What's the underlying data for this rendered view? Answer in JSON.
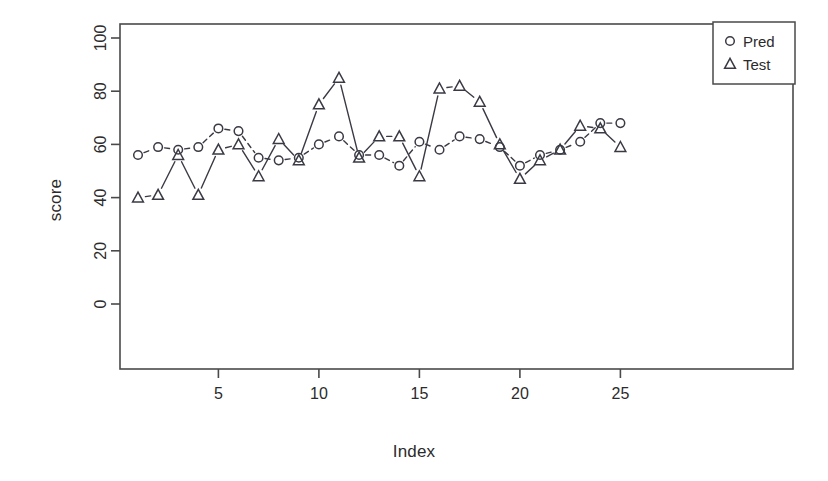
{
  "chart_data": {
    "type": "line",
    "title": "",
    "xlabel": "Index",
    "ylabel": "score",
    "x": [
      1,
      2,
      3,
      4,
      5,
      6,
      7,
      8,
      9,
      10,
      11,
      12,
      13,
      14,
      15,
      16,
      17,
      18,
      19,
      20,
      21,
      22,
      23,
      24,
      25
    ],
    "series": [
      {
        "name": "Pred",
        "marker": "circle",
        "linestyle": "dashed",
        "values": [
          56,
          59,
          58,
          59,
          66,
          65,
          55,
          54,
          55,
          60,
          63,
          56,
          56,
          52,
          61,
          58,
          63,
          62,
          59,
          52,
          56,
          58,
          61,
          68,
          68
        ]
      },
      {
        "name": "Test",
        "marker": "triangle",
        "linestyle": "solid",
        "values": [
          40,
          41,
          56,
          41,
          58,
          60,
          48,
          62,
          54,
          75,
          85,
          55,
          63,
          63,
          48,
          81,
          82,
          76,
          60,
          47,
          54,
          58,
          67,
          66,
          59
        ]
      }
    ],
    "xlim": [
      0.2,
      25.8
    ],
    "ylim": [
      0,
      104
    ],
    "xticks": [
      5,
      10,
      15,
      20,
      25
    ],
    "yticks": [
      0,
      20,
      40,
      60,
      80,
      100
    ],
    "xtick_labels": [
      "5",
      "10",
      "15",
      "20",
      "25"
    ],
    "ytick_labels": [
      "0",
      "20",
      "40",
      "60",
      "80",
      "100"
    ],
    "grid": false,
    "legend": {
      "position": "top-right",
      "entries": [
        {
          "label": "Pred",
          "marker": "circle"
        },
        {
          "label": "Test",
          "marker": "triangle"
        }
      ]
    },
    "colors": {
      "line": "#3a3a44",
      "axis": "#4a4a4a",
      "text": "#2b2b2b",
      "background": "#ffffff"
    }
  }
}
